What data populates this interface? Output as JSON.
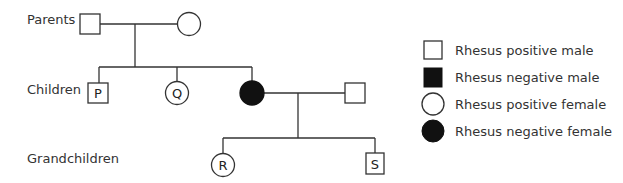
{
  "diagram": {
    "type": "pedigree",
    "generation_labels": {
      "parents": "Parents",
      "children": "Children",
      "grandchildren": "Grandchildren"
    },
    "individuals": [
      {
        "id": "parent-father",
        "label": "",
        "sex": "male",
        "rhesus": "positive"
      },
      {
        "id": "parent-mother",
        "label": "",
        "sex": "female",
        "rhesus": "positive"
      },
      {
        "id": "child-P",
        "label": "P",
        "sex": "male",
        "rhesus": "positive"
      },
      {
        "id": "child-Q",
        "label": "Q",
        "sex": "female",
        "rhesus": "positive"
      },
      {
        "id": "child-daughter",
        "label": "",
        "sex": "female",
        "rhesus": "negative"
      },
      {
        "id": "spouse",
        "label": "",
        "sex": "male",
        "rhesus": "positive"
      },
      {
        "id": "grandchild-R",
        "label": "R",
        "sex": "female",
        "rhesus": "positive"
      },
      {
        "id": "grandchild-S",
        "label": "S",
        "sex": "male",
        "rhesus": "positive"
      }
    ],
    "labels": {
      "P": "P",
      "Q": "Q",
      "R": "R",
      "S": "S"
    },
    "legend": [
      {
        "symbol": "open-square",
        "text": "Rhesus positive male"
      },
      {
        "symbol": "filled-square",
        "text": "Rhesus negative male"
      },
      {
        "symbol": "open-circle",
        "text": "Rhesus positive female"
      },
      {
        "symbol": "filled-circle",
        "text": "Rhesus negative female"
      }
    ],
    "colors": {
      "line": "#333333",
      "fill_negative": "#111111",
      "fill_positive": "#ffffff"
    }
  }
}
